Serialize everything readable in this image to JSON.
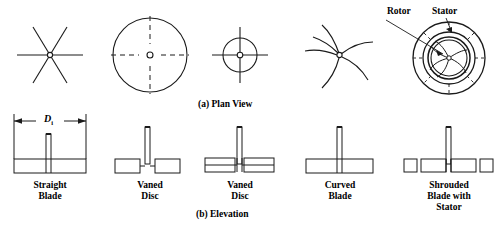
{
  "figure": {
    "plan_caption": "(a) Plan View",
    "elevation_caption": "(b)  Elevation",
    "dimension_label": "D",
    "dimension_subscript": "i",
    "annotations": {
      "rotor": "Rotor",
      "stator": "Stator"
    }
  },
  "impellers": [
    {
      "name": "straight-blade",
      "label_line1": "Straight",
      "label_line2": "Blade",
      "label_line3": "",
      "plan_type": "six-spoke-star",
      "blades": 6
    },
    {
      "name": "vaned-disc-flat",
      "label_line1": "Vaned",
      "label_line2": "Disc",
      "label_line3": "",
      "plan_type": "large-circle-with-dashed-cross",
      "blades": 4
    },
    {
      "name": "vaned-disc-small",
      "label_line1": "Vaned",
      "label_line2": "Disc",
      "label_line3": "",
      "plan_type": "small-circle-with-four-vanes",
      "blades": 4
    },
    {
      "name": "curved-blade",
      "label_line1": "Curved",
      "label_line2": "Blade",
      "label_line3": "",
      "plan_type": "curved-swept-blades",
      "blades": 6
    },
    {
      "name": "shrouded-blade-with-stator",
      "label_line1": "Shrouded",
      "label_line2": "Blade with",
      "label_line3": "Stator",
      "plan_type": "rotor-inside-stator-ring",
      "blades": 6
    }
  ],
  "colors": {
    "line": "#1a1a1a",
    "background": "#ffffff"
  }
}
